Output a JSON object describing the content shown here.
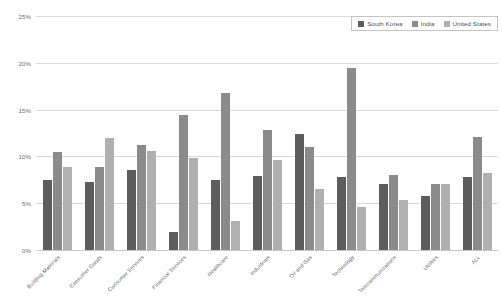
{
  "chart_data": {
    "type": "bar",
    "title": "",
    "xlabel": "",
    "ylabel": "",
    "ylim": [
      0,
      25
    ],
    "y_ticks": [
      "0%",
      "5%",
      "10%",
      "15%",
      "20%",
      "25%"
    ],
    "y_tick_values": [
      0,
      5,
      10,
      15,
      20,
      25
    ],
    "grid": true,
    "legend_position": "top-right",
    "categories": [
      "Building Materials",
      "Consumer Goods",
      "Consumer Services",
      "Financial Services",
      "Healthcare",
      "Industrials",
      "Oil and Gas",
      "Technology",
      "Telecommunications",
      "Utilities",
      "ALL"
    ],
    "series": [
      {
        "name": "South Korea",
        "color": "#5d5d5d",
        "values": [
          7.5,
          7.3,
          8.6,
          1.9,
          7.5,
          7.9,
          12.4,
          7.8,
          7.1,
          5.8,
          7.8
        ]
      },
      {
        "name": "India",
        "color": "#8b8b8b",
        "values": [
          10.5,
          8.9,
          11.2,
          14.4,
          16.8,
          12.8,
          11.0,
          19.4,
          8.0,
          7.1,
          12.1
        ]
      },
      {
        "name": "United States",
        "color": "#b0b0b0",
        "values": [
          8.9,
          12.0,
          10.6,
          9.8,
          3.1,
          9.6,
          6.5,
          4.6,
          5.3,
          7.1,
          8.2
        ]
      }
    ]
  },
  "legend": {
    "items": [
      {
        "label": "South Korea"
      },
      {
        "label": "India"
      },
      {
        "label": "United States"
      }
    ]
  },
  "colors": {
    "series_1": "#5d5d5d",
    "series_2": "#8b8b8b",
    "series_3": "#b0b0b0",
    "gridline": "#d9d9d9",
    "axis_text": "#6d6d6d",
    "background": "#ffffff"
  }
}
